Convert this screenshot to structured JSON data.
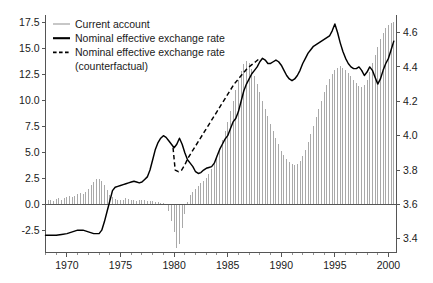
{
  "chart_data": {
    "type": "bar",
    "title": "",
    "subtitle": "",
    "xlabel": "",
    "ylabel": "",
    "grid": false,
    "legend_position": "top-left",
    "x_axis": {
      "label": "",
      "min": 1968.0,
      "max": 2000.75,
      "major_ticks": [
        1970,
        1975,
        1980,
        1985,
        1990,
        1995,
        2000
      ],
      "major_tick_labels": [
        "1970",
        "1975",
        "1980",
        "1985",
        "1990",
        "1995",
        "2000"
      ],
      "minor_tick_step": 1
    },
    "y_axis_left": {
      "label": "",
      "min": -4.6,
      "max": 18.3,
      "ticks": [
        -2.5,
        0.0,
        2.5,
        5.0,
        7.5,
        10.0,
        12.5,
        15.0,
        17.5
      ],
      "tick_labels": [
        "-2.5",
        "0.0",
        "2.5",
        "5.0",
        "7.5",
        "10.0",
        "12.5",
        "15.0",
        "17.5"
      ],
      "series": "Current account"
    },
    "y_axis_right": {
      "label": "",
      "min": 3.32,
      "max": 4.705,
      "ticks": [
        3.4,
        3.6,
        3.8,
        4.0,
        4.2,
        4.4,
        4.6
      ],
      "tick_labels": [
        "3.4",
        "3.6",
        "3.8",
        "4.0",
        "4.2",
        "4.4",
        "4.6"
      ],
      "series": "Nominal effective exchange rate"
    },
    "legend": [
      {
        "label": "Current account",
        "style": "thin-line",
        "color": "#9a9a9a"
      },
      {
        "label": "Nominal effective exchange rate",
        "style": "thick-line",
        "color": "#000000"
      },
      {
        "label": "Nominal effective exchange rate",
        "style": "dashed-line",
        "color": "#000000"
      },
      {
        "label": "(counterfactual)",
        "style": "none",
        "color": "#000000"
      }
    ],
    "series": [
      {
        "name": "Current account",
        "type": "bar",
        "axis": "left",
        "color": "#9a9a9a",
        "x": [
          1968.0,
          1968.25,
          1968.5,
          1968.75,
          1969.0,
          1969.25,
          1969.5,
          1969.75,
          1970.0,
          1970.25,
          1970.5,
          1970.75,
          1971.0,
          1971.25,
          1971.5,
          1971.75,
          1972.0,
          1972.25,
          1972.5,
          1972.75,
          1973.0,
          1973.25,
          1973.5,
          1973.75,
          1974.0,
          1974.25,
          1974.5,
          1974.75,
          1975.0,
          1975.25,
          1975.5,
          1975.75,
          1976.0,
          1976.25,
          1976.5,
          1976.75,
          1977.0,
          1977.25,
          1977.5,
          1977.75,
          1978.0,
          1978.25,
          1978.5,
          1978.75,
          1979.0,
          1979.25,
          1979.5,
          1979.75,
          1980.0,
          1980.25,
          1980.5,
          1980.75,
          1981.0,
          1981.25,
          1981.5,
          1981.75,
          1982.0,
          1982.25,
          1982.5,
          1982.75,
          1983.0,
          1983.25,
          1983.5,
          1983.75,
          1984.0,
          1984.25,
          1984.5,
          1984.75,
          1985.0,
          1985.25,
          1985.5,
          1985.75,
          1986.0,
          1986.25,
          1986.5,
          1986.75,
          1987.0,
          1987.25,
          1987.5,
          1987.75,
          1988.0,
          1988.25,
          1988.5,
          1988.75,
          1989.0,
          1989.25,
          1989.5,
          1989.75,
          1990.0,
          1990.25,
          1990.5,
          1990.75,
          1991.0,
          1991.25,
          1991.5,
          1991.75,
          1992.0,
          1992.25,
          1992.5,
          1992.75,
          1993.0,
          1993.25,
          1993.5,
          1993.75,
          1994.0,
          1994.25,
          1994.5,
          1994.75,
          1995.0,
          1995.25,
          1995.5,
          1995.75,
          1996.0,
          1996.25,
          1996.5,
          1996.75,
          1997.0,
          1997.25,
          1997.5,
          1997.75,
          1998.0,
          1998.25,
          1998.5,
          1998.75,
          1999.0,
          1999.25,
          1999.5,
          1999.75,
          2000.0,
          2000.25,
          2000.5
        ],
        "values": [
          0.35,
          0.45,
          0.5,
          0.4,
          0.55,
          0.65,
          0.5,
          0.6,
          0.7,
          0.8,
          0.7,
          0.85,
          1.0,
          1.15,
          1.05,
          1.25,
          1.5,
          1.9,
          2.2,
          2.45,
          2.5,
          2.3,
          1.9,
          1.4,
          0.9,
          0.7,
          0.55,
          0.5,
          0.45,
          0.5,
          0.6,
          0.55,
          0.5,
          0.45,
          0.4,
          0.45,
          0.5,
          0.45,
          0.4,
          0.35,
          0.4,
          0.3,
          0.25,
          0.2,
          0.15,
          0.1,
          -0.6,
          -1.6,
          -2.6,
          -4.2,
          -3.8,
          -2.2,
          -0.9,
          0.3,
          0.9,
          1.2,
          1.5,
          1.8,
          2.1,
          2.3,
          2.6,
          3.0,
          3.4,
          3.9,
          4.5,
          5.3,
          6.2,
          7.1,
          8.0,
          9.0,
          10.0,
          11.0,
          12.0,
          12.9,
          13.5,
          13.8,
          13.6,
          13.1,
          12.4,
          11.6,
          10.8,
          10.0,
          9.2,
          8.5,
          7.8,
          7.1,
          6.4,
          5.8,
          5.2,
          4.8,
          4.4,
          4.1,
          3.9,
          3.8,
          3.9,
          4.2,
          4.7,
          5.3,
          6.0,
          6.8,
          7.6,
          8.4,
          9.2,
          10.0,
          10.8,
          11.5,
          12.1,
          12.6,
          13.0,
          13.2,
          13.3,
          13.2,
          13.0,
          12.7,
          12.4,
          12.0,
          11.7,
          11.4,
          11.3,
          11.5,
          12.0,
          12.8,
          13.6,
          14.4,
          15.2,
          15.9,
          16.5,
          17.0,
          17.3,
          17.5,
          17.6
        ]
      },
      {
        "name": "Nominal effective exchange rate",
        "type": "line",
        "axis": "right",
        "color": "#000000",
        "style": "solid",
        "x": [
          1968.0,
          1968.5,
          1969.0,
          1969.5,
          1970.0,
          1970.5,
          1971.0,
          1971.5,
          1972.0,
          1972.5,
          1973.0,
          1973.25,
          1973.5,
          1973.75,
          1974.0,
          1974.25,
          1974.5,
          1974.75,
          1975.0,
          1975.25,
          1975.5,
          1975.75,
          1976.0,
          1976.25,
          1976.5,
          1976.75,
          1977.0,
          1977.25,
          1977.5,
          1977.75,
          1978.0,
          1978.25,
          1978.5,
          1978.75,
          1979.0,
          1979.25,
          1979.5,
          1979.75,
          1980.0,
          1980.25,
          1980.5,
          1980.75,
          1981.0,
          1981.25,
          1981.5,
          1981.75,
          1982.0,
          1982.25,
          1982.5,
          1982.75,
          1983.0,
          1983.25,
          1983.5,
          1983.75,
          1984.0,
          1984.25,
          1984.5,
          1984.75,
          1985.0,
          1985.25,
          1985.5,
          1985.75,
          1986.0,
          1986.25,
          1986.5,
          1986.75,
          1987.0,
          1987.25,
          1987.5,
          1987.75,
          1988.0,
          1988.25,
          1988.5,
          1988.75,
          1989.0,
          1989.25,
          1989.5,
          1989.75,
          1990.0,
          1990.25,
          1990.5,
          1990.75,
          1991.0,
          1991.25,
          1991.5,
          1991.75,
          1992.0,
          1992.25,
          1992.5,
          1992.75,
          1993.0,
          1993.25,
          1993.5,
          1993.75,
          1994.0,
          1994.25,
          1994.5,
          1994.75,
          1995.0,
          1995.25,
          1995.5,
          1995.75,
          1996.0,
          1996.25,
          1996.5,
          1996.75,
          1997.0,
          1997.25,
          1997.5,
          1997.75,
          1998.0,
          1998.25,
          1998.5,
          1998.75,
          1999.0,
          1999.25,
          1999.5,
          1999.75,
          2000.0,
          2000.25,
          2000.5
        ],
        "values": [
          3.42,
          3.42,
          3.42,
          3.425,
          3.43,
          3.44,
          3.45,
          3.45,
          3.44,
          3.43,
          3.43,
          3.45,
          3.5,
          3.56,
          3.62,
          3.68,
          3.7,
          3.705,
          3.71,
          3.715,
          3.72,
          3.725,
          3.73,
          3.735,
          3.73,
          3.725,
          3.73,
          3.745,
          3.76,
          3.8,
          3.86,
          3.92,
          3.96,
          3.985,
          4.0,
          3.99,
          3.97,
          3.95,
          3.93,
          3.95,
          3.985,
          3.95,
          3.9,
          3.86,
          3.84,
          3.82,
          3.79,
          3.78,
          3.785,
          3.8,
          3.81,
          3.815,
          3.82,
          3.84,
          3.88,
          3.92,
          3.95,
          3.98,
          4.0,
          4.04,
          4.08,
          4.1,
          4.14,
          4.2,
          4.26,
          4.3,
          4.33,
          4.36,
          4.38,
          4.4,
          4.43,
          4.45,
          4.44,
          4.42,
          4.42,
          4.43,
          4.44,
          4.43,
          4.41,
          4.38,
          4.35,
          4.33,
          4.32,
          4.33,
          4.35,
          4.38,
          4.42,
          4.45,
          4.48,
          4.5,
          4.52,
          4.53,
          4.54,
          4.55,
          4.56,
          4.57,
          4.58,
          4.61,
          4.65,
          4.6,
          4.54,
          4.49,
          4.45,
          4.42,
          4.4,
          4.39,
          4.39,
          4.4,
          4.38,
          4.35,
          4.37,
          4.4,
          4.38,
          4.34,
          4.3,
          4.33,
          4.38,
          4.42,
          4.45,
          4.5,
          4.55
        ]
      },
      {
        "name": "Nominal effective exchange rate (counterfactual)",
        "type": "line",
        "axis": "right",
        "color": "#000000",
        "style": "dashed",
        "x": [
          1979.9,
          1980.1,
          1980.4,
          1980.7,
          1981.0,
          1981.3,
          1981.6,
          1982.0,
          1982.4,
          1982.8,
          1983.2,
          1983.6,
          1984.0,
          1984.4,
          1984.8,
          1985.2,
          1985.6,
          1986.0,
          1986.4,
          1986.8,
          1987.2,
          1987.6,
          1988.0
        ],
        "values": [
          3.93,
          3.8,
          3.79,
          3.8,
          3.83,
          3.87,
          3.9,
          3.94,
          3.98,
          4.02,
          4.06,
          4.1,
          4.14,
          4.18,
          4.22,
          4.26,
          4.3,
          4.33,
          4.36,
          4.39,
          4.41,
          4.43,
          4.45
        ]
      }
    ]
  }
}
